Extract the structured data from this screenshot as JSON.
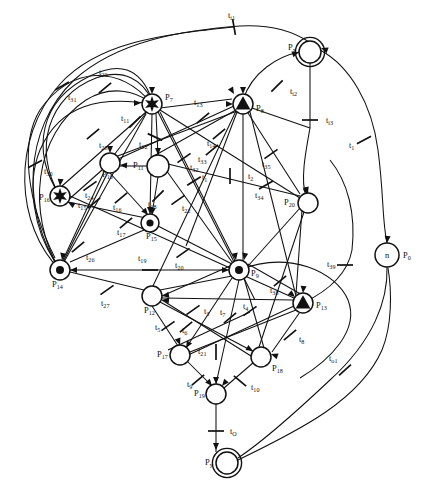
{
  "figure": {
    "kind": "petri-net",
    "title": "",
    "background": "#ffffff",
    "stroke_color": "#111111",
    "width": 421,
    "height": 484
  },
  "places": [
    {
      "id": "P0",
      "label": "P",
      "sub": "0",
      "x": 387,
      "y": 255,
      "r": 12,
      "marking": "n",
      "inner_text": "n",
      "double": false,
      "label_dx": 16,
      "label_dy": 3
    },
    {
      "id": "Px",
      "label": "P",
      "sub": "x",
      "x": 310,
      "y": 52,
      "r": 11,
      "marking": "empty",
      "double": true,
      "label_dx": -22,
      "label_dy": -2
    },
    {
      "id": "Py",
      "label": "P",
      "sub": "y",
      "x": 227,
      "y": 463,
      "r": 11,
      "marking": "empty",
      "double": true,
      "label_dx": -22,
      "label_dy": 2
    },
    {
      "id": "P7",
      "label": "P",
      "sub": "7",
      "x": 152,
      "y": 104,
      "r": 10,
      "marking": "star",
      "double": false,
      "label_dx": 13,
      "label_dy": -4
    },
    {
      "id": "P8",
      "label": "P",
      "sub": "8",
      "x": 243,
      "y": 104,
      "r": 10,
      "marking": "triangle",
      "double": false,
      "label_dx": 13,
      "label_dy": 7
    },
    {
      "id": "P9",
      "label": "P",
      "sub": "9",
      "x": 239,
      "y": 270,
      "r": 10,
      "marking": "dot",
      "double": false,
      "label_dx": 12,
      "label_dy": 6
    },
    {
      "id": "P10",
      "label": "P",
      "sub": "10",
      "x": 110,
      "y": 163,
      "r": 10,
      "marking": "empty",
      "double": false,
      "label_dx": -8,
      "label_dy": 14
    },
    {
      "id": "P11",
      "label": "P",
      "sub": "11",
      "x": 158,
      "y": 166,
      "r": 11,
      "marking": "empty",
      "double": false,
      "label_dx": -25,
      "label_dy": 2
    },
    {
      "id": "P12",
      "label": "P",
      "sub": "12",
      "x": 152,
      "y": 296,
      "r": 10,
      "marking": "empty",
      "double": false,
      "label_dx": -8,
      "label_dy": 17
    },
    {
      "id": "P13",
      "label": "P",
      "sub": "13",
      "x": 303,
      "y": 303,
      "r": 10,
      "marking": "triangle",
      "double": false,
      "label_dx": 13,
      "label_dy": 5
    },
    {
      "id": "P14",
      "label": "P",
      "sub": "14",
      "x": 60,
      "y": 270,
      "r": 10,
      "marking": "dot",
      "double": false,
      "label_dx": -8,
      "label_dy": 17
    },
    {
      "id": "P15",
      "label": "P",
      "sub": "15",
      "x": 150,
      "y": 223,
      "r": 9,
      "marking": "dot",
      "double": false,
      "label_dx": -4,
      "label_dy": 16
    },
    {
      "id": "P16",
      "label": "P",
      "sub": "16",
      "x": 60,
      "y": 196,
      "r": 10,
      "marking": "star",
      "double": false,
      "label_dx": -21,
      "label_dy": 4
    },
    {
      "id": "P17",
      "label": "P",
      "sub": "17",
      "x": 180,
      "y": 355,
      "r": 10,
      "marking": "empty",
      "double": false,
      "label_dx": -23,
      "label_dy": 2
    },
    {
      "id": "P18",
      "label": "P",
      "sub": "18",
      "x": 261,
      "y": 357,
      "r": 10,
      "marking": "empty",
      "double": false,
      "label_dx": 11,
      "label_dy": 14
    },
    {
      "id": "P19",
      "label": "P",
      "sub": "19",
      "x": 216,
      "y": 394,
      "r": 10,
      "marking": "empty",
      "double": false,
      "label_dx": -22,
      "label_dy": 2
    },
    {
      "id": "P20",
      "label": "P",
      "sub": "20",
      "x": 308,
      "y": 203,
      "r": 10,
      "marking": "empty",
      "double": false,
      "label_dx": -24,
      "label_dy": 2
    }
  ],
  "transitions": [
    {
      "id": "ti1",
      "label": "t",
      "sub": "i1",
      "x": 234,
      "y": 27,
      "angle": -10,
      "label_dx": -6,
      "label_dy": -9
    },
    {
      "id": "ti2",
      "label": "t",
      "sub": "i2",
      "x": 277,
      "y": 86,
      "angle": 45,
      "label_dx": 13,
      "label_dy": 8
    },
    {
      "id": "ti3",
      "label": "t",
      "sub": "i3",
      "x": 310,
      "y": 120,
      "angle": 90,
      "label_dx": 16,
      "label_dy": 3
    },
    {
      "id": "t1r",
      "label": "t",
      "sub": "1",
      "x": 364,
      "y": 140,
      "angle": 62,
      "label_dx": -15,
      "label_dy": 8
    },
    {
      "id": "t39",
      "label": "t",
      "sub": "39",
      "x": 345,
      "y": 265,
      "angle": 90,
      "label_dx": -18,
      "label_dy": 2
    },
    {
      "id": "to1",
      "label": "t",
      "sub": "o1",
      "x": 345,
      "y": 370,
      "angle": 48,
      "label_dx": -16,
      "label_dy": -9
    },
    {
      "id": "tO",
      "label": "t",
      "sub": "O",
      "x": 216,
      "y": 431,
      "angle": 90,
      "label_dx": 14,
      "label_dy": 3
    },
    {
      "id": "t29",
      "label": "t",
      "sub": "29",
      "x": 105,
      "y": 88,
      "angle": 50,
      "label_dx": -6,
      "label_dy": -13
    },
    {
      "id": "t31",
      "label": "t",
      "sub": "31",
      "x": 62,
      "y": 86,
      "angle": 60,
      "label_dx": 6,
      "label_dy": 14
    },
    {
      "id": "t30",
      "label": "t",
      "sub": "30",
      "x": 35,
      "y": 164,
      "angle": 62,
      "label_dx": 9,
      "label_dy": 10
    },
    {
      "id": "t28",
      "label": "t",
      "sub": "28",
      "x": 93,
      "y": 134,
      "angle": 50,
      "label_dx": 6,
      "label_dy": 14
    },
    {
      "id": "t11",
      "label": "t",
      "sub": "11",
      "x": 135,
      "y": 122,
      "angle": 45,
      "label_dx": -14,
      "label_dy": -1
    },
    {
      "id": "t12",
      "label": "t",
      "sub": "12",
      "x": 155,
      "y": 137,
      "angle": 115,
      "label_dx": -16,
      "label_dy": 10
    },
    {
      "id": "t13",
      "label": "t",
      "sub": "13",
      "x": 203,
      "y": 118,
      "angle": 50,
      "label_dx": -9,
      "label_dy": -13
    },
    {
      "id": "t14",
      "label": "t",
      "sub": "14",
      "x": 219,
      "y": 134,
      "angle": 50,
      "label_dx": -12,
      "label_dy": 12
    },
    {
      "id": "t33",
      "label": "t",
      "sub": "33",
      "x": 212,
      "y": 150,
      "angle": 50,
      "label_dx": -14,
      "label_dy": 12
    },
    {
      "id": "t2",
      "label": "t",
      "sub": "2",
      "x": 230,
      "y": 176,
      "angle": 0,
      "label_dx": 18,
      "label_dy": 3
    },
    {
      "id": "t35",
      "label": "t",
      "sub": "35",
      "x": 271,
      "y": 154,
      "angle": 55,
      "label_dx": -9,
      "label_dy": 13
    },
    {
      "id": "t34",
      "label": "t",
      "sub": "34",
      "x": 266,
      "y": 185,
      "angle": 60,
      "label_dx": -11,
      "label_dy": 13
    },
    {
      "id": "t32",
      "label": "t",
      "sub": "32",
      "x": 184,
      "y": 158,
      "angle": 55,
      "label_dx": 6,
      "label_dy": 12
    },
    {
      "id": "t1c",
      "label": "t",
      "sub": "1",
      "x": 194,
      "y": 181,
      "angle": 58,
      "label_dx": 8,
      "label_dy": -1
    },
    {
      "id": "t22",
      "label": "t",
      "sub": "22",
      "x": 178,
      "y": 200,
      "angle": 55,
      "label_dx": 4,
      "label_dy": 11
    },
    {
      "id": "t18",
      "label": "t",
      "sub": "18",
      "x": 158,
      "y": 196,
      "angle": 45,
      "label_dx": -10,
      "label_dy": 11
    },
    {
      "id": "t24",
      "label": "t",
      "sub": "24",
      "x": 90,
      "y": 186,
      "angle": 55,
      "label_dx": -5,
      "label_dy": 12
    },
    {
      "id": "t15",
      "label": "t",
      "sub": "15",
      "x": 94,
      "y": 203,
      "angle": 50,
      "label_dx": -16,
      "label_dy": 5
    },
    {
      "id": "t16",
      "label": "t",
      "sub": "16",
      "x": 121,
      "y": 198,
      "angle": 50,
      "label_dx": -8,
      "label_dy": 12
    },
    {
      "id": "t17",
      "label": "t",
      "sub": "17",
      "x": 126,
      "y": 223,
      "angle": 50,
      "label_dx": -9,
      "label_dy": 12
    },
    {
      "id": "t26",
      "label": "t",
      "sub": "26",
      "x": 78,
      "y": 247,
      "angle": 50,
      "label_dx": 8,
      "label_dy": 13
    },
    {
      "id": "t19",
      "label": "t",
      "sub": "19",
      "x": 150,
      "y": 270,
      "angle": 90,
      "label_dx": -12,
      "label_dy": -9
    },
    {
      "id": "t20",
      "label": "t",
      "sub": "20",
      "x": 183,
      "y": 253,
      "angle": 55,
      "label_dx": -8,
      "label_dy": 15
    },
    {
      "id": "t38",
      "label": "t",
      "sub": "38",
      "x": 280,
      "y": 281,
      "angle": 50,
      "label_dx": -10,
      "label_dy": 12
    },
    {
      "id": "t27",
      "label": "t",
      "sub": "27",
      "x": 107,
      "y": 290,
      "angle": 55,
      "label_dx": -6,
      "label_dy": 16
    },
    {
      "id": "t3",
      "label": "t",
      "sub": "3",
      "x": 193,
      "y": 310,
      "angle": 55,
      "label_dx": 11,
      "label_dy": 4
    },
    {
      "id": "t5",
      "label": "t",
      "sub": "5",
      "x": 168,
      "y": 326,
      "angle": 55,
      "label_dx": -13,
      "label_dy": 4
    },
    {
      "id": "t6",
      "label": "t",
      "sub": "6",
      "x": 186,
      "y": 327,
      "angle": 50,
      "label_dx": -4,
      "label_dy": 6
    },
    {
      "id": "t7",
      "label": "t",
      "sub": "7",
      "x": 230,
      "y": 318,
      "angle": 50,
      "label_dx": -10,
      "label_dy": -3
    },
    {
      "id": "t4",
      "label": "t",
      "sub": "4",
      "x": 250,
      "y": 311,
      "angle": 55,
      "label_dx": -7,
      "label_dy": -2
    },
    {
      "id": "t8",
      "label": "t",
      "sub": "8",
      "x": 290,
      "y": 335,
      "angle": 50,
      "label_dx": 9,
      "label_dy": 7
    },
    {
      "id": "t21",
      "label": "t",
      "sub": "21",
      "x": 216,
      "y": 352,
      "angle": 0,
      "label_dx": -18,
      "label_dy": 2
    },
    {
      "id": "t9",
      "label": "t",
      "sub": "9",
      "x": 198,
      "y": 380,
      "angle": 50,
      "label_dx": -11,
      "label_dy": 7
    },
    {
      "id": "t10",
      "label": "t",
      "sub": "10",
      "x": 240,
      "y": 381,
      "angle": -50,
      "label_dx": 11,
      "label_dy": 9
    }
  ],
  "notes": {
    "marking_legend": {
      "dot": "single token",
      "triangle": "token of triangular type",
      "star": "multiple tokens (star glyph)",
      "n": "n tokens",
      "empty": "no tokens"
    }
  }
}
